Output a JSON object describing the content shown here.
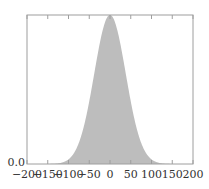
{
  "chart_data": {
    "type": "area",
    "title": "",
    "xlabel": "",
    "ylabel": "",
    "xlim": [
      -200,
      200
    ],
    "ylim": [
      0.0,
      1.0
    ],
    "grid": false,
    "legend": null,
    "x_ticks": [
      -200,
      -150,
      -100,
      -50,
      0,
      50,
      100,
      150,
      200
    ],
    "x_tick_labels": [
      "−200",
      "−150",
      "−100",
      "−50",
      "0",
      "50",
      "100",
      "150",
      "200"
    ],
    "y_tick_labels": [
      "0.0"
    ],
    "series": [
      {
        "name": "distribution",
        "shape": "gaussian",
        "mean": 0,
        "sigma": 38,
        "peak": 1.0,
        "fill_color": "#bdbdbd"
      }
    ]
  },
  "colors": {
    "axis": "#9e9e9e",
    "fill": "#bdbdbd",
    "text": "#333333"
  }
}
